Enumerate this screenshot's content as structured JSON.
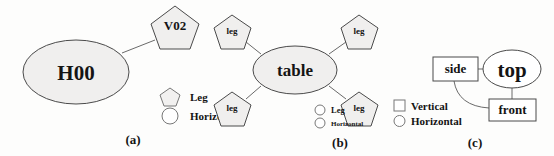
{
  "figure": {
    "panels": [
      {
        "id": "a",
        "caption": "(a)",
        "nodes": [
          {
            "label": "H00",
            "shape": "ellipse"
          },
          {
            "label": "V02",
            "shape": "pentagon"
          }
        ],
        "legend": [
          {
            "marker": "pentagon",
            "label": "Leg"
          },
          {
            "marker": "circle",
            "label": "Horizonta"
          }
        ]
      },
      {
        "id": "b",
        "caption": "(b)",
        "nodes": [
          {
            "label": "table",
            "shape": "ellipse"
          },
          {
            "label": "leg",
            "shape": "pentagon"
          },
          {
            "label": "leg",
            "shape": "pentagon"
          },
          {
            "label": "leg",
            "shape": "pentagon"
          },
          {
            "label": "leg",
            "shape": "pentagon"
          }
        ],
        "legend": [
          {
            "marker": "circle",
            "label": "Leg"
          },
          {
            "marker": "circle",
            "label": "Horizontal"
          }
        ]
      },
      {
        "id": "c",
        "caption": "(c)",
        "nodes": [
          {
            "label": "side",
            "shape": "rectangle"
          },
          {
            "label": "top",
            "shape": "ellipse"
          },
          {
            "label": "front",
            "shape": "rectangle"
          }
        ],
        "legend": [
          {
            "marker": "square",
            "label": "Vertical"
          },
          {
            "marker": "circle",
            "label": "Horizontal"
          }
        ]
      }
    ]
  },
  "colors": {
    "background": "#fdfdfc",
    "node_fill": "#f0efee",
    "node_stroke": "#4a4a4a",
    "connector": "#6a6a6a",
    "text": "#141414"
  }
}
